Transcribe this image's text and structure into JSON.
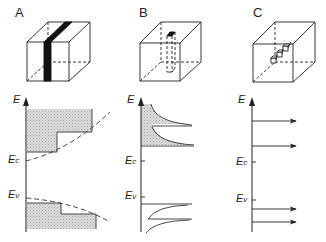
{
  "panels": [
    {
      "id": "A",
      "label": "A",
      "energy_label": "E",
      "ec_label": "E",
      "ec_sub": "c",
      "ev_label": "E",
      "ev_sub": "v",
      "structure": "quantum-well-slab",
      "dos": "step-like"
    },
    {
      "id": "B",
      "label": "B",
      "energy_label": "E",
      "ec_label": "E",
      "ec_sub": "c",
      "ev_label": "E",
      "ev_sub": "v",
      "structure": "quantum-wire",
      "dos": "inverse-square-root-peaks"
    },
    {
      "id": "C",
      "label": "C",
      "energy_label": "E",
      "ec_label": "E",
      "ec_sub": "c",
      "ev_label": "E",
      "ev_sub": "v",
      "structure": "quantum-dot",
      "dos": "discrete-delta-levels"
    }
  ],
  "colors": {
    "line": "#222222",
    "fill": "#d4d4d4",
    "bar": "#111111"
  }
}
